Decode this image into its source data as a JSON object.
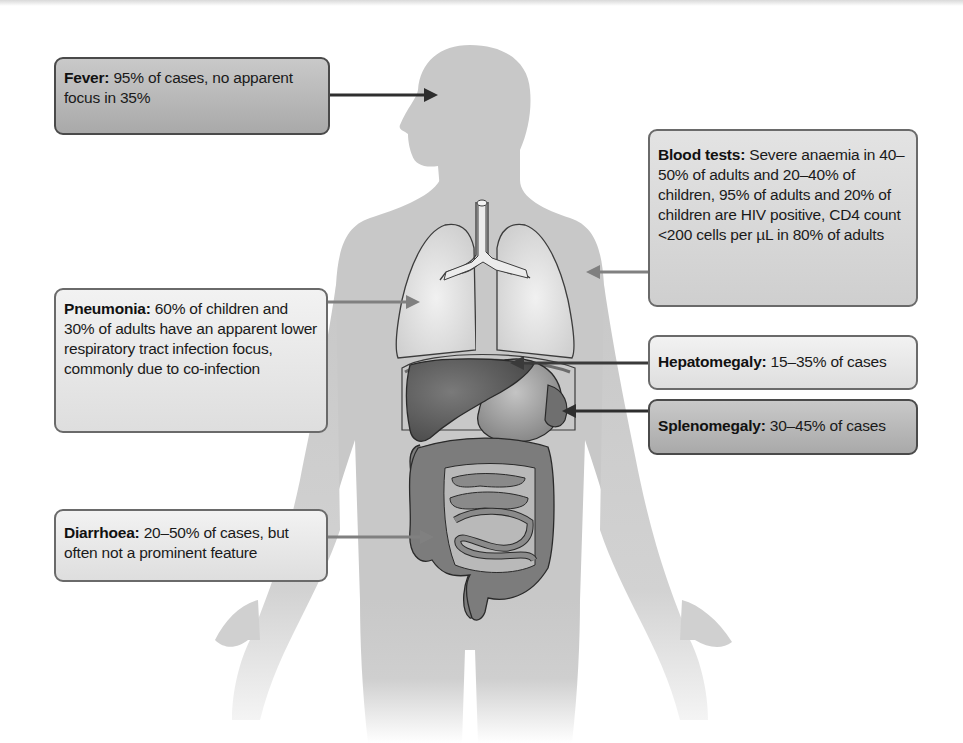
{
  "figure": {
    "colors": {
      "body": "#c8c8c8",
      "lungs": "#dcdcdc",
      "liver": "#5e5e5e",
      "stomach": "#9a9a9a",
      "intestine": "#7c7c7c",
      "arrow_dark": "#2e2e2e",
      "arrow_mid": "#808080"
    }
  },
  "callouts": [
    {
      "id": "fever",
      "title": "Fever:",
      "text": " 95% of cases, no apparent focus in 35%",
      "shade": "dark",
      "target": "head"
    },
    {
      "id": "blood-tests",
      "title": "Blood tests:",
      "text": " Severe anaemia in 40–50% of adults and 20–40% of children, 95% of adults and 20% of children are HIV positive, CD4 count <200 cells per µL in 80% of adults",
      "shade": "mid",
      "target": "right-shoulder"
    },
    {
      "id": "pneumonia",
      "title": "Pneumonia:",
      "text": " 60% of children and 30% of adults have an apparent lower respiratory tract infection focus, commonly due to co-infection",
      "shade": "light",
      "target": "right-lung"
    },
    {
      "id": "hepatomegaly",
      "title": "Hepatomegaly:",
      "text": " 15–35% of cases",
      "shade": "light",
      "target": "liver"
    },
    {
      "id": "splenomegaly",
      "title": "Splenomegaly:",
      "text": " 30–45% of cases",
      "shade": "dark",
      "target": "spleen"
    },
    {
      "id": "diarrhoea",
      "title": "Diarrhoea:",
      "text": " 20–50% of cases, but often not a prominent feature",
      "shade": "light",
      "target": "colon"
    }
  ]
}
